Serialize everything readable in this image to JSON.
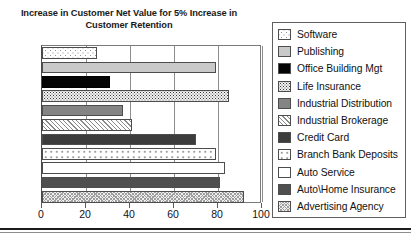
{
  "chart_data": {
    "type": "bar",
    "orientation": "horizontal",
    "title": "Increase in Customer Net Value for 5% Increase in Customer Retention",
    "xlabel": "",
    "ylabel": "",
    "xlim": [
      0,
      100
    ],
    "xticks": [
      0,
      20,
      40,
      60,
      80,
      100
    ],
    "xtick_labels": [
      "0",
      "20",
      "40",
      "60",
      "80",
      "100"
    ],
    "grid": true,
    "grid_axis": "x",
    "legend_position": "right",
    "categories": [
      "Software",
      "Publishing",
      "Office Building Mgt",
      "Life Insurance",
      "Industrial Distribution",
      "Industrial Brokerage",
      "Credit Card",
      "Branch Bank Deposits",
      "Auto Service",
      "Auto\\Home Insurance",
      "Advertising Agency"
    ],
    "values": [
      25,
      79,
      31,
      85,
      37,
      41,
      70,
      79,
      83,
      81,
      92
    ],
    "series": [
      {
        "name": "Increase in Customer Net Value",
        "values": [
          25,
          79,
          31,
          85,
          37,
          41,
          70,
          79,
          83,
          81,
          92
        ]
      }
    ]
  },
  "title": {
    "line1": "Increase in Customer Net Value for 5% Increase in",
    "line2": "Customer Retention"
  },
  "axis": {
    "tick_labels": [
      "0",
      "20",
      "40",
      "60",
      "80",
      "100"
    ]
  },
  "legend": {
    "items": [
      {
        "label": "Software",
        "pattern": "fill-software",
        "value": 25
      },
      {
        "label": "Publishing",
        "pattern": "fill-publishing",
        "value": 79
      },
      {
        "label": "Office Building Mgt",
        "pattern": "fill-officebldg",
        "value": 31
      },
      {
        "label": "Life Insurance",
        "pattern": "fill-lifeins",
        "value": 85
      },
      {
        "label": "Industrial Distribution",
        "pattern": "fill-inddist",
        "value": 37
      },
      {
        "label": "Industrial Brokerage",
        "pattern": "fill-indbrok",
        "value": 41
      },
      {
        "label": "Credit Card",
        "pattern": "fill-creditcard",
        "value": 70
      },
      {
        "label": "Branch Bank Deposits",
        "pattern": "fill-branchbank",
        "value": 79
      },
      {
        "label": "Auto Service",
        "pattern": "fill-autoservice",
        "value": 83
      },
      {
        "label": "Auto\\Home Insurance",
        "pattern": "fill-autohome",
        "value": 81
      },
      {
        "label": "Advertising Agency",
        "pattern": "fill-advertising",
        "value": 92
      }
    ]
  }
}
